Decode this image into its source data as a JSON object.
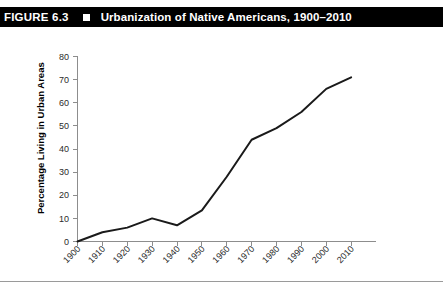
{
  "figure": {
    "label": "FIGURE 6.3",
    "bullet_icon": "square-bullet-icon",
    "title": "Urbanization of Native Americans, 1900–2010"
  },
  "chart_data": {
    "type": "line",
    "title": "Urbanization of Native Americans, 1900–2010",
    "xlabel": "",
    "ylabel": "Percentage Living in Urban Areas",
    "categories": [
      "1900",
      "1910",
      "1920",
      "1930",
      "1940",
      "1950",
      "1960",
      "1970",
      "1980",
      "1990",
      "2000",
      "2010"
    ],
    "values": [
      0,
      4,
      6,
      10,
      7,
      13.5,
      28,
      44,
      49,
      56,
      66,
      71
    ],
    "ylim": [
      0,
      80
    ],
    "yticks": [
      0,
      10,
      20,
      30,
      40,
      50,
      60,
      70,
      80
    ],
    "ytick_labels": [
      "0",
      "10",
      "20",
      "30",
      "40",
      "50",
      "60",
      "70",
      "80"
    ],
    "xtick_labels": [
      "1900",
      "1910",
      "1920",
      "1930",
      "1940",
      "1950",
      "1960",
      "1970",
      "1980",
      "1990",
      "2000",
      "2010"
    ],
    "grid": false,
    "legend": null,
    "series": [
      {
        "name": "Percentage Living in Urban Areas",
        "color": "#1a1a1a",
        "values": [
          0,
          4,
          6,
          10,
          7,
          13.5,
          28,
          44,
          49,
          56,
          66,
          71
        ]
      }
    ]
  },
  "colors": {
    "banner_background": "#000000",
    "banner_text": "#ffffff",
    "line": "#1a1a1a",
    "axis": "#8d8d8d",
    "rule": "#9a9a9a"
  }
}
